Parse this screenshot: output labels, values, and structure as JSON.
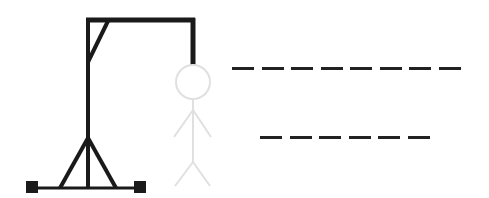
{
  "game": {
    "type": "hangman",
    "colors": {
      "gallows": "#1a1a1a",
      "figure_inactive": "#e0e0e0",
      "slot": "#222222",
      "background": "#ffffff"
    },
    "figure": {
      "parts": [
        "head",
        "body",
        "left-arm",
        "right-arm",
        "left-leg",
        "right-leg"
      ],
      "state": "not-revealed"
    },
    "words": [
      {
        "length": 8,
        "letters": [
          "",
          "",
          "",
          "",
          "",
          "",
          "",
          ""
        ]
      },
      {
        "length": 6,
        "letters": [
          "",
          "",
          "",
          "",
          "",
          ""
        ]
      }
    ]
  }
}
